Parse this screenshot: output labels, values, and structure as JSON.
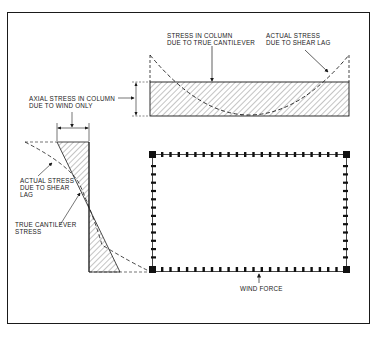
{
  "figure": {
    "type": "structural-diagram"
  },
  "labels": {
    "stress_true_cantilever_line1": "STRESS IN COLUMN",
    "stress_true_cantilever_line2": "DUE TO TRUE CANTILEVER",
    "actual_stress_top_line1": "ACTUAL STRESS",
    "actual_stress_top_line2": "DUE TO SHEAR LAG",
    "axial_stress_line1": "AXIAL STRESS IN COLUMN",
    "axial_stress_line2": "DUE TO WIND ONLY",
    "actual_stress_left_line1": "ACTUAL STRESS",
    "actual_stress_left_line2": "DUE TO SHEAR",
    "actual_stress_left_line3": "LAG",
    "true_cantilever_line1": "TRUE CANTILEVER",
    "true_cantilever_line2": "STRESS",
    "wind_force": "WIND FORCE"
  },
  "colors": {
    "ink": "#1a1a1a",
    "hatch": "#555555",
    "background": "#ffffff"
  }
}
